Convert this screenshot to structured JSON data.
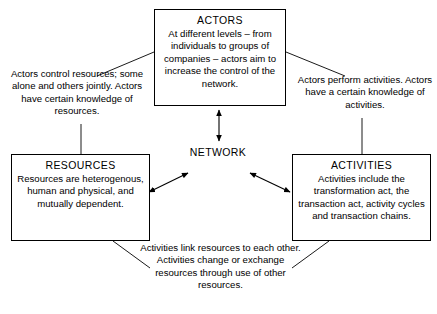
{
  "diagram": {
    "center_label": "NETWORK",
    "stroke_color": "#000000",
    "background_color": "#ffffff"
  },
  "nodes": {
    "actors": {
      "title": "ACTORS",
      "body": "At different levels – from individuals to groups of companies – actors aim to increase the control of the network."
    },
    "resources": {
      "title": "RESOURCES",
      "body": "Resources are heterogenous, human and physical, and mutually dependent."
    },
    "activities": {
      "title": "ACTIVITIES",
      "body": "Activities include the transformation act, the transaction act, activity cycles and transaction chains."
    }
  },
  "notes": {
    "actors_resources": "Actors control resources; some alone and others jointly. Actors have certain knowledge of resources.",
    "actors_activities": "Actors perform activities. Actors have a certain knowledge of activities.",
    "resources_activities": "Activities link resources to each other. Activities change or exchange resources through use of other resources."
  },
  "connectors": [
    {
      "name": "actors-network",
      "kind": "double-arrow",
      "from": "actors",
      "to": "network"
    },
    {
      "name": "network-resources",
      "kind": "double-arrow",
      "from": "network",
      "to": "resources"
    },
    {
      "name": "network-activities",
      "kind": "double-arrow",
      "from": "network",
      "to": "activities"
    },
    {
      "name": "actors-to-left-note",
      "kind": "leader-line",
      "from": "actors",
      "to": "actors_resources_note"
    },
    {
      "name": "left-note-to-resources",
      "kind": "leader-line",
      "from": "actors_resources_note",
      "to": "resources"
    },
    {
      "name": "actors-to-right-note",
      "kind": "leader-line",
      "from": "actors",
      "to": "actors_activities_note"
    },
    {
      "name": "right-note-to-activities",
      "kind": "leader-line",
      "from": "actors_activities_note",
      "to": "activities"
    },
    {
      "name": "resources-to-bottom-note",
      "kind": "leader-line",
      "from": "resources",
      "to": "resources_activities_note"
    },
    {
      "name": "activities-to-bottom-note",
      "kind": "leader-line",
      "from": "activities",
      "to": "resources_activities_note"
    }
  ]
}
